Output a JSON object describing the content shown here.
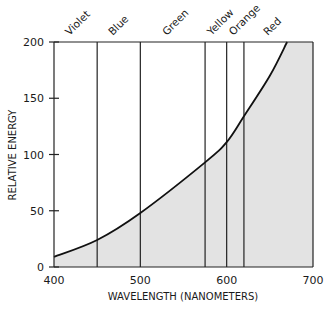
{
  "chart_data": {
    "type": "area",
    "title": "",
    "xlabel": "WAVELENGTH (NANOMETERS)",
    "ylabel": "RELATIVE ENERGY",
    "xlim": [
      400,
      700
    ],
    "ylim": [
      0,
      200
    ],
    "x_ticks": [
      400,
      500,
      600,
      700
    ],
    "y_ticks": [
      0,
      50,
      100,
      150,
      200
    ],
    "grid": false,
    "legend": null,
    "series": [
      {
        "name": "Relative energy",
        "x": [
          400,
          450,
          500,
          575,
          600,
          620,
          650,
          670
        ],
        "values": [
          9,
          24,
          48,
          93,
          111,
          134,
          170,
          200
        ]
      }
    ],
    "bands": [
      {
        "label": "Violet",
        "from": 400,
        "to": 450
      },
      {
        "label": "Blue",
        "from": 450,
        "to": 500
      },
      {
        "label": "Green",
        "from": 500,
        "to": 575
      },
      {
        "label": "Yellow",
        "from": 575,
        "to": 600
      },
      {
        "label": "Orange",
        "from": 600,
        "to": 620
      },
      {
        "label": "Red",
        "from": 620,
        "to": 700
      }
    ],
    "band_boundaries": [
      450,
      500,
      575,
      600,
      620
    ],
    "colors": {
      "fill": "#e3e3e3",
      "line": "#111111",
      "axis": "#222222"
    }
  }
}
